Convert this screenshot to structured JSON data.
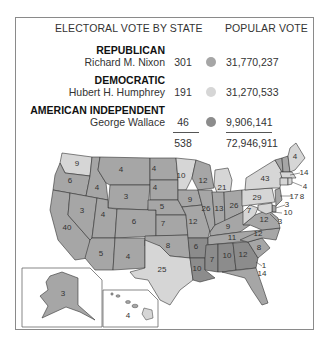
{
  "header": {
    "electoral_vote_label": "ELECTORAL VOTE BY STATE",
    "popular_vote_label": "POPULAR VOTE"
  },
  "legend": [
    {
      "party": "REPUBLICAN",
      "candidate": "Richard M. Nixon",
      "electoral_votes": "301",
      "popular_votes": "31,770,237",
      "color": "#a6a6a6"
    },
    {
      "party": "DEMOCRATIC",
      "candidate": "Hubert H. Humphrey",
      "electoral_votes": "191",
      "popular_votes": "31,270,533",
      "color": "#d6d6d6"
    },
    {
      "party": "AMERICAN INDEPENDENT",
      "candidate": "George Wallace",
      "electoral_votes": "46",
      "popular_votes": "9,906,141",
      "color": "#8c8c8c"
    }
  ],
  "totals": {
    "electoral_votes": "538",
    "popular_votes": "72,946,911"
  },
  "colors": {
    "republican": "#a6a6a6",
    "democratic": "#d6d6d6",
    "independent": "#8c8c8c",
    "border": "#333333",
    "frame": "#8a8a8a"
  },
  "states": {
    "WA": "9",
    "OR": "6",
    "CA": "40",
    "ID": "4",
    "NV": "3",
    "MT": "4",
    "WY": "3",
    "UT": "4",
    "AZ": "5",
    "CO": "6",
    "NM": "4",
    "ND": "4",
    "SD": "4",
    "NE": "5",
    "KS": "7",
    "OK": "8",
    "TX": "25",
    "MN": "10",
    "IA": "9",
    "MO": "12",
    "AR": "6",
    "LA": "10",
    "WI": "12",
    "IL": "26",
    "MS": "7",
    "MI": "21",
    "IN": "13",
    "OH": "26",
    "KY": "9",
    "TN": "11",
    "AL": "10",
    "GA": "12",
    "FL": "14",
    "SC": "8",
    "NC": "12",
    "VA": "12",
    "WV": "7",
    "PA": "29",
    "NY": "43",
    "ME": "4",
    "NH": "4",
    "VT": "3",
    "MA": "14",
    "RI": "4",
    "CT": "8",
    "NJ": "17",
    "DE": "3",
    "MD": "10",
    "DC": "3",
    "NC_1": "1",
    "AK": "3",
    "HI": "4"
  }
}
